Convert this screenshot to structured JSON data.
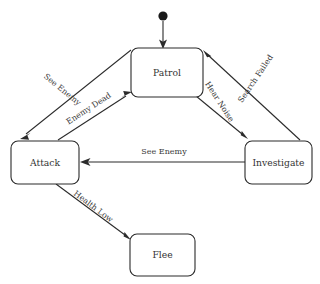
{
  "diagram": {
    "type": "finite-state-machine",
    "colors": {
      "background": "#ffffff",
      "stroke": "#2b2b2b",
      "box_fill": "#ffffff",
      "label_text": "#333333",
      "start_dot": "#1a1a1a"
    },
    "start_node": {
      "name": "start-node",
      "shape": "filled-circle",
      "cx": 163,
      "cy": 16,
      "r": 4.6
    },
    "states": [
      {
        "id": "patrol",
        "label": "Patrol",
        "x": 131,
        "y": 48,
        "w": 72,
        "h": 49
      },
      {
        "id": "attack",
        "label": "Attack",
        "x": 11,
        "y": 141,
        "w": 68,
        "h": 43
      },
      {
        "id": "investigate",
        "label": "Investigate",
        "x": 245,
        "y": 141,
        "w": 67,
        "h": 43
      },
      {
        "id": "flee",
        "label": "Flee",
        "x": 130,
        "y": 234,
        "w": 65,
        "h": 42
      }
    ],
    "transitions": [
      {
        "id": "start-to-patrol",
        "label": "",
        "from": "start",
        "to": "patrol",
        "lx": 0,
        "ly": 0,
        "rot": 0
      },
      {
        "id": "patrol-to-attack",
        "label": "See Enemy",
        "from": "patrol",
        "to": "attack",
        "lx": 62,
        "ly": 90,
        "rot": 39
      },
      {
        "id": "attack-to-patrol",
        "label": "Enemy Dead",
        "from": "attack",
        "to": "patrol",
        "lx": 89,
        "ly": 109,
        "rot": -36
      },
      {
        "id": "patrol-to-investigate",
        "label": "Hear Noise",
        "from": "patrol",
        "to": "investigate",
        "lx": 219,
        "ly": 102,
        "rot": 57
      },
      {
        "id": "investigate-to-patrol",
        "label": "Search Failed",
        "from": "investigate",
        "to": "patrol",
        "lx": 256,
        "ly": 79,
        "rot": -57
      },
      {
        "id": "investigate-to-attack",
        "label": "See Enemy",
        "from": "investigate",
        "to": "attack",
        "lx": 164,
        "ly": 152,
        "rot": 0
      },
      {
        "id": "attack-to-flee",
        "label": "Health Low",
        "from": "attack",
        "to": "flee",
        "lx": 93,
        "ly": 207,
        "rot": 39
      }
    ]
  }
}
